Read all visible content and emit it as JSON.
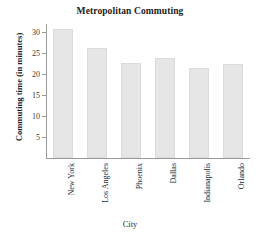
{
  "chart_data": {
    "type": "bar",
    "title": "Metropolitan Commuting",
    "xlabel": "City",
    "ylabel": "Commuting time (in minutes)",
    "categories": [
      "New York",
      "Los Angeles",
      "Phoenix",
      "Dallas",
      "Indianapolis",
      "Orlando"
    ],
    "values": [
      30.8,
      26.2,
      22.8,
      24.0,
      21.6,
      22.5
    ],
    "ylim": [
      0,
      32
    ],
    "yticks": [
      5,
      10,
      15,
      20,
      25,
      30
    ],
    "ytick_labels": [
      "5",
      "10",
      "15",
      "20",
      "25",
      "30"
    ],
    "grid": false,
    "legend": null,
    "bar_color": "#e6e6e6",
    "axis_color": "#9a9a9a",
    "text_color": "#2b2b2b"
  }
}
